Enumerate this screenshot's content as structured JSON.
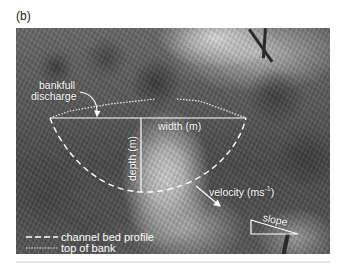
{
  "figure": {
    "panel_label": "(b)",
    "photo_description": "Grayscale photograph of a tree-lined creek channel with annotated hydraulic geometry",
    "annotations": {
      "bankfull_line1": "bankfull",
      "bankfull_line2": "discharge",
      "width": "width (m)",
      "depth": "depth (m)",
      "velocity_prefix": "velocity (ms",
      "velocity_exp": "-1",
      "velocity_suffix": ")",
      "slope": "slope"
    },
    "legend": [
      {
        "symbol": "dashed-line",
        "label": "channel bed profile"
      },
      {
        "symbol": "dotted-line",
        "label": "top of bank"
      }
    ],
    "colors": {
      "annotation": "#ffffff",
      "photo_tone": "#555555"
    }
  }
}
